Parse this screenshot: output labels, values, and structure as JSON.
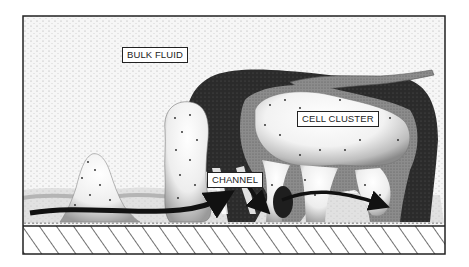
{
  "figure": {
    "labels": {
      "bulk_fluid": "BULK FLUID",
      "cell_cluster": "CELL CLUSTER",
      "channel": "CHANNEL"
    },
    "regions": [
      "bulk fluid",
      "cell clusters",
      "water channels",
      "substratum"
    ],
    "colors": {
      "background": "#ffffff",
      "fluid_stipple": "#f1f1f1",
      "cluster_dark": "#2a2a2a",
      "cluster_light": "#e8e8e8",
      "outline": "#222222"
    }
  }
}
